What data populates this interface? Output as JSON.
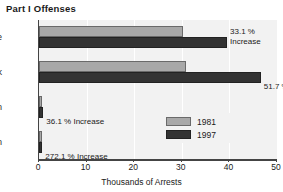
{
  "chart_data": {
    "type": "bar",
    "title": "Part I Offenses",
    "orientation": "horizontal",
    "xlabel": "Thousands of Arrests",
    "ylabel": "",
    "xlim": [
      0,
      50
    ],
    "xticks": [
      0,
      10,
      20,
      30,
      40,
      50
    ],
    "xtick_labels": [
      "0",
      "10",
      "20",
      "30",
      "40",
      "50"
    ],
    "grid": true,
    "legend_position": "center-right",
    "categories": [
      "White",
      "Black",
      "Indian",
      "Asian"
    ],
    "series": [
      {
        "name": "1981",
        "color": "#a8a8a8",
        "values": [
          30.2,
          30.9,
          0.6,
          0.2
        ]
      },
      {
        "name": "1997",
        "color": "#333333",
        "values": [
          39.5,
          46.6,
          0.9,
          0.7
        ]
      }
    ],
    "annotations": [
      {
        "category": "White",
        "line1": "33.1 %",
        "line2": "Increase"
      },
      {
        "category": "Black",
        "line1": "51.7 % Increase",
        "line2": ""
      },
      {
        "category": "Indian",
        "line1": "36.1 % Increase",
        "line2": ""
      },
      {
        "category": "Asian",
        "line1": "272.1 % Increase",
        "line2": ""
      }
    ]
  },
  "colors": {
    "background": "#ffffff",
    "plot_background": "#f2f2f2",
    "axis": "#444444",
    "gridline": "#ffffff",
    "text": "#1a1a1a",
    "series_1981": "#a8a8a8",
    "series_1997": "#333333"
  }
}
